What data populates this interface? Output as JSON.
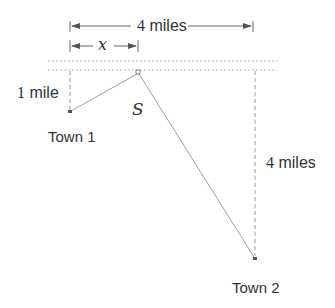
{
  "diagram": {
    "labels": {
      "total_distance": "4 miles",
      "x_variable": "x",
      "town1_distance": "1 mile",
      "town1_distance_num": "1",
      "town1_distance_unit": " mile",
      "town2_distance": "4 miles",
      "town2_distance_num": "4",
      "town2_distance_unit": " miles",
      "total_distance_num": "4",
      "total_distance_unit": " miles",
      "station": "S",
      "town1": "Town 1",
      "town2": "Town 2"
    },
    "colors": {
      "line": "#9a9a9a",
      "dash": "#b0b0b0",
      "arrow": "#555555",
      "text": "#333333",
      "point": "#555555"
    },
    "geometry": {
      "road_y_top": 61,
      "road_y_bottom": 70,
      "town1": {
        "x": 70,
        "y": 112
      },
      "station": {
        "x": 138,
        "y": 72
      },
      "town2": {
        "x": 255,
        "y": 258
      }
    }
  }
}
